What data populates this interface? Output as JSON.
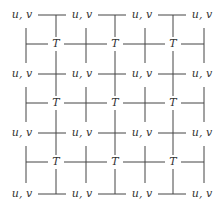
{
  "diagram": {
    "node_label_uv": "u, v",
    "node_label_t": "T",
    "uv_columns_x": [
      22,
      82,
      142,
      202
    ],
    "uv_rows_y": [
      15,
      74,
      133,
      194
    ],
    "t_columns_x": [
      56,
      115,
      173
    ],
    "t_rows_y": [
      44,
      103,
      162
    ],
    "uv_vertical_x": [
      26,
      86,
      145,
      204
    ],
    "line_color": "#444444",
    "text_color": "#333333"
  }
}
